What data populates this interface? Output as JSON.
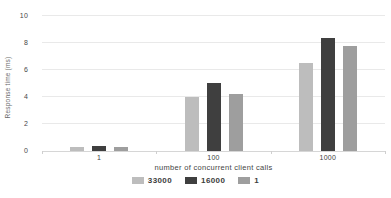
{
  "chart_data": {
    "type": "bar",
    "title": "",
    "categories": [
      "1",
      "100",
      "1000"
    ],
    "series": [
      {
        "name": "33000",
        "color": "#bdbdbd",
        "values": [
          0.3,
          4.0,
          6.5
        ]
      },
      {
        "name": "16000",
        "color": "#3f3f3f",
        "values": [
          0.35,
          5.0,
          8.4
        ]
      },
      {
        "name": "1",
        "color": "#9e9e9e",
        "values": [
          0.3,
          4.2,
          7.8
        ]
      }
    ],
    "xlabel": "number of concurrent client calls",
    "ylabel": "Response time (ms)",
    "ylim": [
      0,
      10
    ],
    "yticks": [
      0,
      2,
      4,
      6,
      8,
      10
    ],
    "grid": true,
    "legend_position": "bottom"
  },
  "colors": {
    "background": "#ffffff",
    "gridline": "#e9e9e9",
    "axis_line": "#d6d6d6",
    "tick_text": "#474747",
    "axis_title_text": "#454545",
    "legend_text": "#3d3d3d"
  }
}
